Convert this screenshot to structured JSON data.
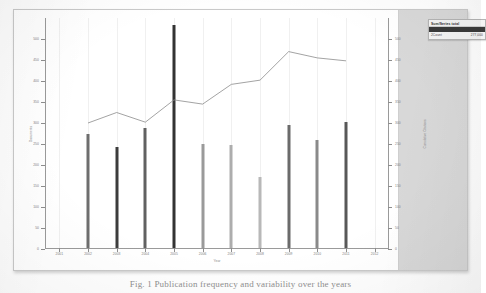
{
  "figure": {
    "caption": "Fig. 1  Publication frequency and variability over the years"
  },
  "legend": {
    "title": "Sum/Series total",
    "rows": [
      {
        "label": "Series 1",
        "value": "",
        "selected": true
      },
      {
        "label": "2Count",
        "value": "277,000",
        "selected": false
      }
    ]
  },
  "chart_data": {
    "type": "bar",
    "title": "",
    "xlabel": "Year",
    "ylabel": "Documents",
    "ylabel_right": "Cumulative Citations",
    "grid": true,
    "legend_position": "top-right",
    "x": [
      "2001",
      "2002",
      "2003",
      "2004",
      "2005",
      "2006",
      "2007",
      "2008",
      "2009",
      "2010",
      "2011",
      "2012"
    ],
    "categories": [
      "2002",
      "2003",
      "2004",
      "2005",
      "2006",
      "2007",
      "2008",
      "2009",
      "2010",
      "2011"
    ],
    "xlim": [
      "2001",
      "2012"
    ],
    "ylim": [
      0,
      550
    ],
    "ytick_labels": [
      "0",
      "50",
      "100",
      "150",
      "200",
      "250",
      "300",
      "350",
      "400",
      "450",
      "500"
    ],
    "ytick_values": [
      0,
      50,
      100,
      150,
      200,
      250,
      300,
      350,
      400,
      450,
      500
    ],
    "ylim_right": [
      0,
      550
    ],
    "ytick_labels_right": [
      "0",
      "50",
      "100",
      "150",
      "200",
      "250",
      "300",
      "350",
      "400",
      "450",
      "500"
    ],
    "ytick_values_right": [
      0,
      50,
      100,
      150,
      200,
      250,
      300,
      350,
      400,
      450,
      500
    ],
    "series": [
      {
        "name": "Documents",
        "type": "bar",
        "axis": "left",
        "categories": [
          "2002",
          "2003",
          "2004",
          "2005",
          "2006",
          "2007",
          "2008",
          "2009",
          "2010",
          "2011"
        ],
        "values": [
          272,
          240,
          285,
          530,
          248,
          245,
          170,
          292,
          258,
          300
        ],
        "colors": [
          "#6e6e6e",
          "#3c3c3c",
          "#616161",
          "#333333",
          "#9a9a9a",
          "#adadad",
          "#b8b8b8",
          "#6b6b6b",
          "#8a8a8a",
          "#585858"
        ]
      },
      {
        "name": "Cumulative Citations",
        "type": "line",
        "axis": "right",
        "color": "#8c8c8c",
        "x": [
          "2002",
          "2003",
          "2004",
          "2005",
          "2006",
          "2007",
          "2008",
          "2009",
          "2010",
          "2011"
        ],
        "values": [
          300,
          325,
          302,
          355,
          345,
          392,
          402,
          470,
          455,
          448
        ]
      }
    ]
  }
}
